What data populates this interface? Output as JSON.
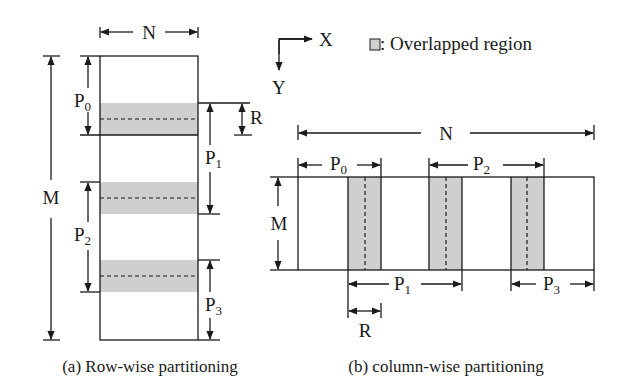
{
  "legend": {
    "axis_x": "X",
    "axis_y": "Y",
    "overlap_label": ": Overlapped region",
    "overlap_color": "#cfcfcf"
  },
  "row_wise": {
    "caption": "(a) Row-wise partitioning",
    "width_label": "N",
    "height_label": "M",
    "overlap_label": "R",
    "partitions": [
      {
        "name": "P",
        "sub": "0"
      },
      {
        "name": "P",
        "sub": "1"
      },
      {
        "name": "P",
        "sub": "2"
      },
      {
        "name": "P",
        "sub": "3"
      }
    ]
  },
  "column_wise": {
    "caption": "(b) column-wise partitioning",
    "width_label": "N",
    "height_label": "M",
    "overlap_label": "R",
    "partitions": [
      {
        "name": "P",
        "sub": "0"
      },
      {
        "name": "P",
        "sub": "1"
      },
      {
        "name": "P",
        "sub": "2"
      },
      {
        "name": "P",
        "sub": "3"
      }
    ]
  }
}
